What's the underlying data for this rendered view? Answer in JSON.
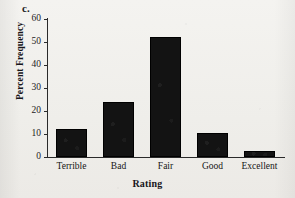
{
  "panel": {
    "letter": "c."
  },
  "chart_data": {
    "type": "bar",
    "title": "",
    "subtitle": "",
    "xlabel": "Rating",
    "ylabel": "Percent Frequency",
    "categories": [
      "Terrible",
      "Bad",
      "Fair",
      "Good",
      "Excellent"
    ],
    "values": [
      12,
      24,
      52,
      10.5,
      2.5
    ],
    "ylim": [
      0,
      60
    ],
    "yticks": [
      0,
      10,
      20,
      30,
      40,
      50,
      60
    ],
    "ytick_labels": [
      "0",
      "10",
      "20",
      "30",
      "40",
      "50",
      "60"
    ],
    "grid": false,
    "legend": null,
    "legend_position": "none",
    "bar_color": "#111111",
    "axis_color": "#2a2a2a",
    "background_color": "#f2f1ee",
    "annotations": []
  }
}
